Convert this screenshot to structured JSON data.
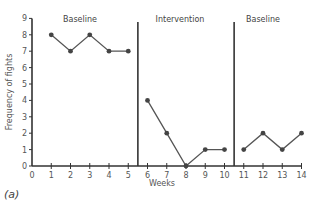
{
  "chart_data": {
    "type": "line",
    "title": "",
    "panel_label": "(a)",
    "xlabel": "Weeks",
    "ylabel": "Frequency of fights",
    "xlim": [
      0,
      14
    ],
    "ylim": [
      0,
      9
    ],
    "xticks": [
      0,
      1,
      2,
      3,
      4,
      5,
      6,
      7,
      8,
      9,
      10,
      11,
      12,
      13,
      14
    ],
    "yticks": [
      0,
      1,
      2,
      3,
      4,
      5,
      6,
      7,
      8,
      9
    ],
    "grid": false,
    "phases": [
      {
        "label": "Baseline",
        "start": 0,
        "end": 5.5
      },
      {
        "label": "Intervention",
        "start": 5.5,
        "end": 10.5
      },
      {
        "label": "Baseline",
        "start": 10.5,
        "end": 14
      }
    ],
    "phase_lines": [
      5.5,
      10.5
    ],
    "series": [
      {
        "name": "Baseline",
        "x": [
          1,
          2,
          3,
          4,
          5
        ],
        "values": [
          8,
          7,
          8,
          7,
          7
        ]
      },
      {
        "name": "Intervention",
        "x": [
          6,
          7,
          8,
          9,
          10
        ],
        "values": [
          4,
          2,
          0,
          1,
          1
        ]
      },
      {
        "name": "Baseline (return)",
        "x": [
          11,
          12,
          13,
          14
        ],
        "values": [
          1,
          2,
          1,
          2
        ]
      }
    ],
    "colors": {
      "line": "#555555",
      "marker": "#444444",
      "axis": "#333333",
      "phase_line": "#333333"
    }
  }
}
